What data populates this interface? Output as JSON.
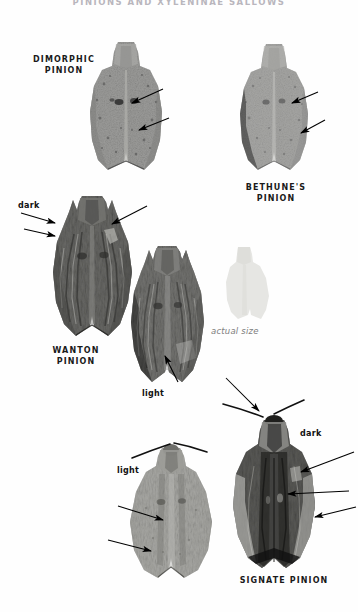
{
  "page": {
    "running_head": "PINIONS AND XYLENINAE SALLOWS",
    "background_color": "#fefefe"
  },
  "specimens": [
    {
      "id": "dimorphic-pinion",
      "common_name": "DIMORPHIC\nPINION",
      "label_x": 28,
      "label_y": 54,
      "label_width": 72,
      "tone": "pale-speckled",
      "plate_x": 88,
      "plate_y": 40,
      "plate_width": 76,
      "plate_height": 132
    },
    {
      "id": "bethunes-pinion",
      "common_name": "BETHUNE'S\nPINION",
      "label_x": 228,
      "label_y": 182,
      "label_width": 96,
      "tone": "pale-speckled",
      "plate_x": 238,
      "plate_y": 42,
      "plate_width": 72,
      "plate_height": 130
    },
    {
      "id": "wanton-pinion",
      "common_name": "WANTON\nPINION",
      "label_x": 34,
      "label_y": 345,
      "label_width": 84,
      "tone": "dark-mottled",
      "plate_x": 52,
      "plate_y": 192,
      "plate_width": 82,
      "plate_height": 146
    },
    {
      "id": "wanton-pinion-light",
      "common_name": "",
      "tone": "mid-mottled",
      "plate_x": 130,
      "plate_y": 244,
      "plate_width": 76,
      "plate_height": 140
    },
    {
      "id": "signate-pinion-light",
      "common_name": "",
      "tone": "pale-grey",
      "plate_x": 128,
      "plate_y": 434,
      "plate_width": 86,
      "plate_height": 146
    },
    {
      "id": "signate-pinion",
      "common_name": "SIGNATE PINION",
      "label_x": 232,
      "label_y": 575,
      "label_width": 104,
      "tone": "dark-streaked",
      "plate_x": 232,
      "plate_y": 412,
      "plate_width": 84,
      "plate_height": 158
    }
  ],
  "actual_size": {
    "caption": "actual size",
    "caption_x": 211,
    "caption_y": 326,
    "swatch_x": 218,
    "swatch_y": 246,
    "swatch_width": 52,
    "swatch_height": 76,
    "color": "#e8e8e6"
  },
  "callouts": [
    {
      "id": "wanton-dark",
      "text": "dark",
      "x": 18,
      "y": 201
    },
    {
      "id": "wanton-light",
      "text": "light",
      "x": 142,
      "y": 389
    },
    {
      "id": "signate-light",
      "text": "light",
      "x": 117,
      "y": 466
    },
    {
      "id": "signate-dark",
      "text": "dark",
      "x": 300,
      "y": 429
    }
  ],
  "arrows": [
    {
      "id": "arrow-dimorphic-1",
      "x1": 163,
      "y1": 89,
      "x2": 129,
      "y2": 104
    },
    {
      "id": "arrow-dimorphic-2",
      "x1": 169,
      "y1": 118,
      "x2": 136,
      "y2": 131
    },
    {
      "id": "arrow-bethunes-1",
      "x1": 318,
      "y1": 92,
      "x2": 289,
      "y2": 104
    },
    {
      "id": "arrow-bethunes-2",
      "x1": 325,
      "y1": 120,
      "x2": 298,
      "y2": 134
    },
    {
      "id": "arrow-wanton-dark-1",
      "x1": 21,
      "y1": 213,
      "x2": 57,
      "y2": 224
    },
    {
      "id": "arrow-wanton-dark-2",
      "x1": 24,
      "y1": 229,
      "x2": 57,
      "y2": 237
    },
    {
      "id": "arrow-wanton-top",
      "x1": 147,
      "y1": 206,
      "x2": 109,
      "y2": 226
    },
    {
      "id": "arrow-wanton-light",
      "x1": 178,
      "y1": 382,
      "x2": 163,
      "y2": 353
    },
    {
      "id": "arrow-signate-light-1",
      "x1": 118,
      "y1": 506,
      "x2": 166,
      "y2": 521
    },
    {
      "id": "arrow-signate-light-2",
      "x1": 108,
      "y1": 540,
      "x2": 154,
      "y2": 552
    },
    {
      "id": "arrow-signate-top",
      "x1": 226,
      "y1": 378,
      "x2": 262,
      "y2": 414
    },
    {
      "id": "arrow-signate-dark-1",
      "x1": 354,
      "y1": 452,
      "x2": 298,
      "y2": 473
    },
    {
      "id": "arrow-signate-dark-2",
      "x1": 349,
      "y1": 491,
      "x2": 285,
      "y2": 494
    },
    {
      "id": "arrow-signate-dark-3",
      "x1": 356,
      "y1": 507,
      "x2": 312,
      "y2": 518
    }
  ],
  "antennae": [
    {
      "id": "antenna-signate-light-left",
      "path": "M 131 457 Q 152 450 170 443"
    },
    {
      "id": "antenna-signate-light-right",
      "path": "M 208 452 Q 190 446 172 442"
    },
    {
      "id": "antenna-signate-dark-left",
      "path": "M 222 404 Q 245 411 262 418"
    },
    {
      "id": "antenna-signate-dark-right",
      "path": "M 305 400 Q 288 408 272 416"
    }
  ]
}
